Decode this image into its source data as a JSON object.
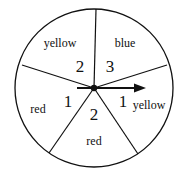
{
  "diagram": {
    "type": "spinner",
    "center": {
      "x": 94,
      "y": 88
    },
    "radius": 79,
    "sectors": [
      {
        "id": "top-left",
        "color_label": "yellow",
        "number": "2",
        "label_pos": {
          "x": 60,
          "y": 47
        },
        "num_pos": {
          "x": 80,
          "y": 72
        }
      },
      {
        "id": "top-right",
        "color_label": "blue",
        "number": "3",
        "label_pos": {
          "x": 125,
          "y": 47
        },
        "num_pos": {
          "x": 110,
          "y": 72
        }
      },
      {
        "id": "right",
        "color_label": "yellow",
        "number": "1",
        "label_pos": {
          "x": 149,
          "y": 109
        },
        "num_pos": {
          "x": 123,
          "y": 107
        }
      },
      {
        "id": "bottom",
        "color_label": "red",
        "number": "2",
        "label_pos": {
          "x": 94,
          "y": 145
        },
        "num_pos": {
          "x": 94,
          "y": 120
        }
      },
      {
        "id": "left",
        "color_label": "red",
        "number": "1",
        "label_pos": {
          "x": 38,
          "y": 113
        },
        "num_pos": {
          "x": 68,
          "y": 107
        }
      }
    ],
    "arrow": {
      "from_x": 77,
      "to_x": 146,
      "y": 88,
      "direction": "right"
    }
  }
}
